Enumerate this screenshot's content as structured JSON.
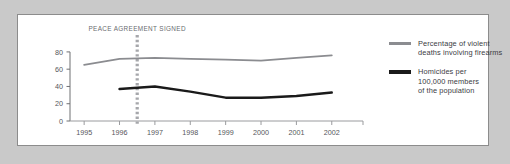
{
  "figure": {
    "background_color": "#ffffff",
    "page_color": "#c9c9c9",
    "border_color": "#8c8c8c"
  },
  "annotation": {
    "label": "PEACE AGREEMENT SIGNED",
    "at_x": 1996.5,
    "line_style": "dashed",
    "color": "#a6a7ab"
  },
  "legend": {
    "position": "right",
    "entries": [
      {
        "color": "#8b8c90",
        "lines": [
          "Percentage of violent",
          "deaths involving firearms"
        ]
      },
      {
        "color": "#1a1a1a",
        "lines": [
          "Homicides per",
          "100,000 members",
          "of the population"
        ]
      }
    ]
  },
  "chart_data": {
    "type": "line",
    "title": "",
    "xlabel": "",
    "ylabel": "",
    "categories": [
      "1995",
      "1996",
      "1997",
      "1998",
      "1999",
      "2000",
      "2001",
      "2002"
    ],
    "x": [
      1995,
      1996,
      1997,
      1998,
      1999,
      2000,
      2001,
      2002
    ],
    "xlim": [
      1994.6,
      2002.6
    ],
    "ylim": [
      0,
      88
    ],
    "yticks": [
      0,
      20,
      40,
      60,
      80
    ],
    "ytick_labels": [
      "0",
      "20",
      "40",
      "60",
      "80"
    ],
    "grid": false,
    "series": [
      {
        "name": "Percentage of violent deaths involving firearms",
        "color": "#8b8c90",
        "width": 1.8,
        "x": [
          1995,
          1996,
          1997,
          1998,
          1999,
          2000,
          2001,
          2002
        ],
        "values": [
          65,
          72,
          73,
          72,
          71,
          70,
          73,
          76
        ]
      },
      {
        "name": "Homicides per 100,000 members of the population",
        "color": "#1a1a1a",
        "width": 2.4,
        "x": [
          1996,
          1997,
          1998,
          1999,
          2000,
          2001,
          2002
        ],
        "values": [
          37,
          40,
          34,
          27,
          27,
          29,
          33
        ]
      }
    ]
  }
}
